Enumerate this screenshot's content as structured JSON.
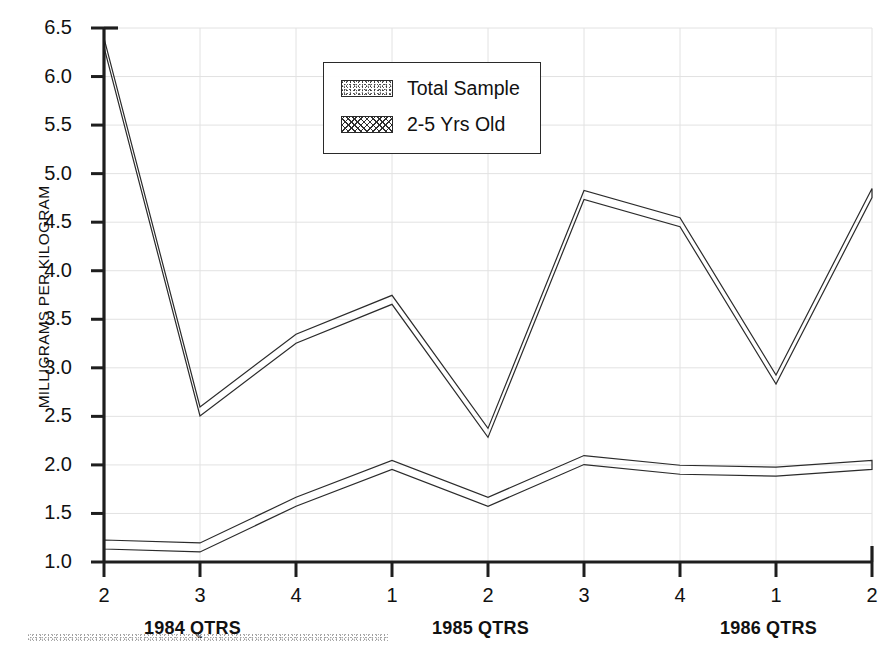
{
  "chart_data": {
    "type": "line",
    "title": "",
    "subtitle": "",
    "xlabel": "QTRS",
    "ylabel": "MILLIGRAMS PER KILOGRAM",
    "ylim": [
      1.0,
      6.5
    ],
    "yticks": [
      "1.0",
      "1.5",
      "2.0",
      "2.5",
      "3.0",
      "3.5",
      "4.0",
      "4.5",
      "5.0",
      "5.5",
      "6.0",
      "6.5"
    ],
    "ytick_values": [
      1.0,
      1.5,
      2.0,
      2.5,
      3.0,
      3.5,
      4.0,
      4.5,
      5.0,
      5.5,
      6.0,
      6.5
    ],
    "grid": true,
    "legend_position": "top-center",
    "categories": [
      "2",
      "3",
      "4",
      "1",
      "2",
      "3",
      "4",
      "1",
      "2"
    ],
    "x_group_labels": [
      {
        "text": "1984 QTRS",
        "at_index": 1
      },
      {
        "text": "1985 QTRS",
        "at_index": 4
      },
      {
        "text": "1986 QTRS",
        "at_index": 7
      }
    ],
    "series": [
      {
        "name": "Total Sample",
        "pattern": "stipple",
        "values": [
          1.18,
          1.15,
          1.62,
          2.0,
          1.62,
          2.05,
          1.95,
          1.93,
          2.0
        ]
      },
      {
        "name": "2-5 Yrs Old",
        "pattern": "crosshatch",
        "values": [
          6.35,
          2.55,
          3.3,
          3.7,
          2.33,
          4.78,
          4.5,
          2.88,
          4.8
        ]
      }
    ]
  },
  "legend": {
    "items": [
      {
        "label": "Total Sample",
        "pattern": "stipple"
      },
      {
        "label": "2-5 Yrs Old",
        "pattern": "crosshatch"
      }
    ]
  },
  "axes": {
    "y_title": "MILLIGRAMS PER KILOGRAM"
  }
}
